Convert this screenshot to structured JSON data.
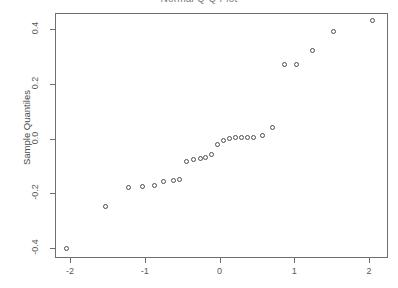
{
  "chart_data": {
    "type": "scatter",
    "title": "Normal Q-Q Plot",
    "xlabel": "",
    "ylabel": "Sample Quantiles",
    "xlim": [
      -2.2,
      2.2
    ],
    "ylim": [
      -0.44,
      0.46
    ],
    "xticks": [
      -2,
      -1,
      0,
      1,
      2
    ],
    "xtick_labels": [
      "-2",
      "-1",
      "0",
      "1",
      "2"
    ],
    "yticks": [
      0.4,
      0.2,
      0.0,
      -0.2,
      -0.4
    ],
    "ytick_labels": [
      "0.4",
      "0.2",
      "0.0",
      "-0.2",
      "-0.4"
    ],
    "grid": false,
    "legend": false,
    "marker": "open-circle",
    "marker_color": "#4d4d4d",
    "n_points": 26,
    "x": [
      -2.05,
      -1.53,
      -1.22,
      -1.03,
      -0.87,
      -0.75,
      -0.62,
      -0.54,
      -0.44,
      -0.35,
      -0.26,
      -0.19,
      -0.11,
      -0.03,
      0.06,
      0.13,
      0.21,
      0.29,
      0.37,
      0.46,
      0.57,
      0.71,
      0.87,
      1.03,
      1.24,
      1.52,
      2.05
    ],
    "y": [
      -0.4,
      -0.25,
      -0.18,
      -0.175,
      -0.172,
      -0.157,
      -0.155,
      -0.148,
      -0.085,
      -0.075,
      -0.072,
      -0.068,
      -0.06,
      -0.022,
      -0.008,
      0.0,
      0.003,
      0.002,
      0.003,
      0.005,
      0.01,
      0.04,
      0.27,
      0.27,
      0.32,
      0.39,
      0.43
    ]
  },
  "axes": {
    "y_title": "Sample Quantiles",
    "x_title": ""
  }
}
